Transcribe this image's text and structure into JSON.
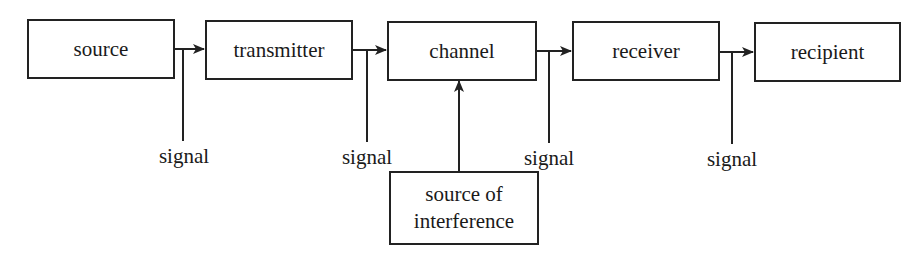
{
  "diagram": {
    "type": "communication-model-flow",
    "stroke_color": "#222222",
    "background_color": "#ffffff",
    "nodes": {
      "source": "source",
      "transmitter": "transmitter",
      "channel": "channel",
      "receiver": "receiver",
      "recipient": "recipient",
      "interference_line1": "source of",
      "interference_line2": "interference"
    },
    "signal_labels": [
      "signal",
      "signal",
      "signal",
      "signal"
    ],
    "edges": [
      {
        "from": "source",
        "to": "transmitter",
        "tap_label": "signal"
      },
      {
        "from": "transmitter",
        "to": "channel",
        "tap_label": "signal"
      },
      {
        "from": "channel",
        "to": "receiver",
        "tap_label": "signal"
      },
      {
        "from": "receiver",
        "to": "recipient",
        "tap_label": "signal"
      },
      {
        "from": "source of interference",
        "to": "channel"
      }
    ]
  }
}
